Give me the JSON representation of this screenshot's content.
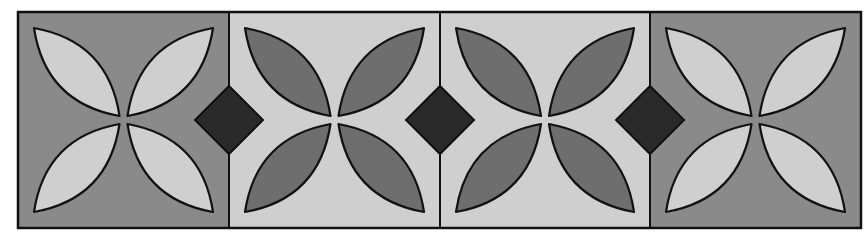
{
  "figure": {
    "colors": {
      "background": "#ffffff",
      "outline": "#111111",
      "dark_gray": "#8a8a8a",
      "light_gray": "#cfcfcf",
      "petal_dark": "#6e6e6e",
      "diamond": "#2a2a2a"
    },
    "blocks": [
      {
        "id": 1,
        "background": "dark_gray",
        "petals": "light_gray"
      },
      {
        "id": 2,
        "background": "light_gray",
        "petals": "petal_dark"
      },
      {
        "id": 3,
        "background": "light_gray",
        "petals": "petal_dark"
      },
      {
        "id": 4,
        "background": "dark_gray",
        "petals": "light_gray"
      }
    ],
    "diamonds": 3
  }
}
